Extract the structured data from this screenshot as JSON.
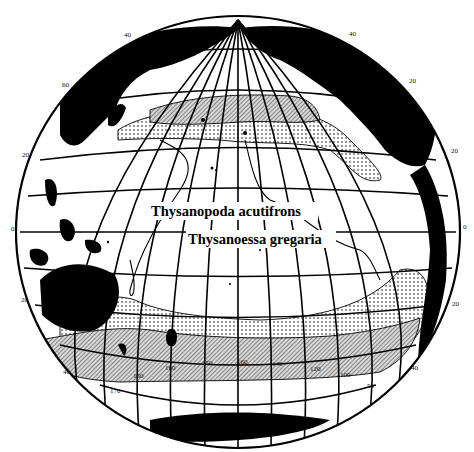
{
  "map": {
    "title": "Pacific Ocean distribution of two euphausiid species",
    "projection": "orthographic globe centered on central Pacific",
    "colors": {
      "land": "#000000",
      "ocean": "#ffffff",
      "grid": "#000000"
    },
    "labels": {
      "species_1": "Thysanopoda acutifrons",
      "species_2": "Thysanoessa gregaria"
    },
    "latitude_ticks_left": [
      {
        "label": "60",
        "x": 62,
        "y": 87
      },
      {
        "label": "40",
        "x": 124,
        "y": 37
      },
      {
        "label": "20",
        "x": 22,
        "y": 157
      },
      {
        "label": "0",
        "x": 11,
        "y": 231
      },
      {
        "label": "20",
        "x": 21,
        "y": 302
      },
      {
        "label": "40",
        "x": 63,
        "y": 374
      }
    ],
    "latitude_ticks_right": [
      {
        "label": "40",
        "x": 349,
        "y": 36
      },
      {
        "label": "20",
        "x": 409,
        "y": 83
      },
      {
        "label": "20",
        "x": 451,
        "y": 153
      },
      {
        "label": "0",
        "x": 463,
        "y": 229
      },
      {
        "label": "20",
        "x": 452,
        "y": 306
      },
      {
        "label": "40",
        "x": 411,
        "y": 370
      }
    ],
    "longitude_ticks_south": [
      {
        "label": "170",
        "x": 110,
        "y": 393
      },
      {
        "label": "160",
        "x": 133,
        "y": 378
      },
      {
        "label": "160",
        "x": 165,
        "y": 370
      },
      {
        "label": "150",
        "x": 202,
        "y": 365
      },
      {
        "label": "160",
        "x": 237,
        "y": 364
      },
      {
        "label": "140",
        "x": 272,
        "y": 366
      },
      {
        "label": "120",
        "x": 310,
        "y": 371
      },
      {
        "label": "100",
        "x": 340,
        "y": 377
      },
      {
        "label": "50",
        "x": 367,
        "y": 388
      }
    ],
    "legend_patterns": [
      {
        "name": "hatched",
        "meaning": "Thysanoessa gregaria range (dense)"
      },
      {
        "name": "stippled",
        "meaning": "Thysanoessa gregaria range (sparse)"
      },
      {
        "name": "outline",
        "meaning": "Thysanopoda acutifrons range boundary"
      }
    ]
  }
}
